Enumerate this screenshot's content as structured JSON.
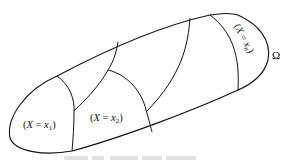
{
  "diagram": {
    "region_label": "Ω",
    "partitions": [
      {
        "label_open": "(",
        "var": "X",
        "eq": " = ",
        "val": "x",
        "sub": "1",
        "label_close": ")"
      },
      {
        "label_open": "(",
        "var": "X",
        "eq": " = ",
        "val": "x",
        "sub": "2",
        "label_close": ")"
      },
      {
        "label_open": "(",
        "var": "X",
        "eq": " = ",
        "val": "x",
        "sub": "n",
        "label_close": ")"
      }
    ],
    "colors": {
      "stroke": "#111111",
      "background": "#ffffff",
      "caption": "#d8d8d8"
    }
  }
}
